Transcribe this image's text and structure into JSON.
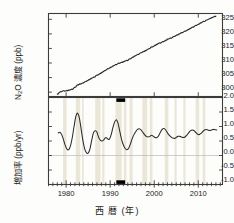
{
  "figure": {
    "xlabel": "西 暦 (年)",
    "background": "#fdfdfb",
    "axis_color": "#3c3c3c",
    "line_color": "#2a2a2a",
    "band_color": "#ebe7d8",
    "marker_color": "#000000"
  },
  "panels": {
    "top": {
      "ylabel_main": "N",
      "ylabel_sub": "2",
      "ylabel_rest": "O 濃度 (ppb)",
      "ylabel_full": "N2O 濃度 (ppb)",
      "yticks": [
        "325",
        "320",
        "315",
        "310",
        "305",
        "300"
      ],
      "ylim": [
        298.5,
        327.0
      ]
    },
    "bottom": {
      "ylabel_full": "増加率 (ppb/yr)",
      "yticks": [
        "2.0",
        "1.5",
        "1.0",
        "0.5",
        "0.0",
        "-0.5",
        "-1.0"
      ],
      "ylim": [
        -1.0,
        2.0
      ]
    }
  },
  "xaxis": {
    "ticks": [
      "1980",
      "1990",
      "2000",
      "2010"
    ],
    "tickvalues": [
      1980,
      1990,
      2000,
      2010
    ],
    "xlim": [
      1976.0,
      2015.5
    ]
  },
  "chart_data": {
    "type": "line",
    "title": "",
    "xlabel": "西 暦 (年)",
    "grid": false,
    "legend": "none",
    "subplots": [
      {
        "name": "n2o-concentration",
        "type": "line",
        "ylabel": "N2O 濃度 (ppb)",
        "ylim": [
          298.5,
          327.0
        ],
        "yticks": [
          300,
          305,
          310,
          315,
          320,
          325
        ],
        "xlim": [
          1976.0,
          2015.5
        ],
        "x": [
          1978.0,
          1978.5,
          1979.0,
          1979.5,
          1980.0,
          1980.5,
          1981.0,
          1981.5,
          1982.0,
          1982.5,
          1983.0,
          1983.5,
          1984.0,
          1984.5,
          1985.0,
          1985.5,
          1986.0,
          1986.5,
          1987.0,
          1987.5,
          1988.0,
          1988.5,
          1989.0,
          1989.5,
          1990.0,
          1990.5,
          1991.0,
          1991.5,
          1992.0,
          1992.5,
          1993.0,
          1993.5,
          1994.0,
          1994.5,
          1995.0,
          1995.5,
          1996.0,
          1996.5,
          1997.0,
          1997.5,
          1998.0,
          1998.5,
          1999.0,
          1999.5,
          2000.0,
          2000.5,
          2001.0,
          2001.5,
          2002.0,
          2002.5,
          2003.0,
          2003.5,
          2004.0,
          2004.5,
          2005.0,
          2005.5,
          2006.0,
          2006.5,
          2007.0,
          2007.5,
          2008.0,
          2008.5,
          2009.0,
          2009.5,
          2010.0,
          2010.5,
          2011.0,
          2011.5,
          2012.0,
          2012.5,
          2013.0,
          2013.5,
          2014.0
        ],
        "y": [
          299.2,
          299.9,
          300.3,
          300.4,
          300.5,
          300.6,
          300.8,
          301.1,
          301.6,
          302.4,
          302.7,
          302.9,
          303.3,
          303.7,
          304.1,
          304.5,
          304.9,
          305.3,
          305.8,
          306.2,
          306.6,
          307.1,
          307.6,
          308.0,
          308.4,
          308.8,
          309.2,
          309.6,
          309.9,
          310.2,
          310.4,
          310.7,
          311.0,
          311.4,
          311.9,
          312.3,
          312.7,
          313.1,
          313.5,
          313.9,
          314.2,
          314.6,
          315.1,
          315.5,
          315.9,
          316.3,
          316.7,
          317.0,
          317.3,
          317.7,
          318.1,
          318.4,
          318.7,
          319.1,
          319.5,
          319.8,
          320.2,
          320.6,
          320.9,
          321.3,
          321.7,
          322.1,
          322.5,
          322.9,
          323.3,
          323.7,
          324.1,
          324.4,
          324.8,
          325.2,
          325.5,
          325.8,
          326.1
        ],
        "series_note": "monotonic increase ~299 ppb (1978) to ~326 ppb (2014)"
      },
      {
        "name": "n2o-growth-rate",
        "type": "line",
        "ylabel": "増加率 (ppb/yr)",
        "ylim": [
          -1.0,
          2.0
        ],
        "yticks": [
          -1.0,
          -0.5,
          0.0,
          0.5,
          1.0,
          1.5,
          2.0
        ],
        "xlim": [
          1976.0,
          2015.5
        ],
        "zero_line": 0.0,
        "x": [
          1978.2,
          1978.6,
          1979.0,
          1979.4,
          1979.8,
          1980.2,
          1980.6,
          1981.0,
          1981.4,
          1981.8,
          1982.2,
          1982.6,
          1983.0,
          1983.4,
          1983.8,
          1984.2,
          1984.6,
          1985.0,
          1985.4,
          1985.8,
          1986.2,
          1986.6,
          1987.0,
          1987.4,
          1987.8,
          1988.2,
          1988.6,
          1989.0,
          1989.4,
          1989.8,
          1990.2,
          1990.6,
          1991.0,
          1991.4,
          1991.8,
          1992.2,
          1992.6,
          1993.0,
          1993.4,
          1993.8,
          1994.2,
          1994.6,
          1995.0,
          1995.4,
          1995.8,
          1996.2,
          1996.6,
          1997.0,
          1997.4,
          1997.8,
          1998.2,
          1998.6,
          1999.0,
          1999.4,
          1999.8,
          2000.2,
          2000.6,
          2001.0,
          2001.4,
          2001.8,
          2002.2,
          2002.6,
          2003.0,
          2003.4,
          2003.8,
          2004.2,
          2004.6,
          2005.0,
          2005.4,
          2005.8,
          2006.2,
          2006.6,
          2007.0,
          2007.4,
          2007.8,
          2008.2,
          2008.6,
          2009.0,
          2009.4,
          2009.8,
          2010.2,
          2010.6,
          2011.0,
          2011.4,
          2011.8,
          2012.2,
          2012.6,
          2013.0,
          2013.4,
          2013.8,
          2014.2
        ],
        "y": [
          0.78,
          0.8,
          0.72,
          0.55,
          0.35,
          0.22,
          0.2,
          0.34,
          0.62,
          1.0,
          1.34,
          1.46,
          1.3,
          0.92,
          0.52,
          0.24,
          0.1,
          0.08,
          0.22,
          0.52,
          0.78,
          0.85,
          0.8,
          0.62,
          0.52,
          0.5,
          0.55,
          0.62,
          0.58,
          0.56,
          0.7,
          0.95,
          1.15,
          1.23,
          1.1,
          0.82,
          0.55,
          0.36,
          0.24,
          0.2,
          0.25,
          0.4,
          0.58,
          0.72,
          0.82,
          0.9,
          0.92,
          0.88,
          0.8,
          0.72,
          0.66,
          0.64,
          0.66,
          0.7,
          0.66,
          0.62,
          0.62,
          0.68,
          0.8,
          0.9,
          0.93,
          0.88,
          0.78,
          0.7,
          0.64,
          0.6,
          0.59,
          0.62,
          0.66,
          0.66,
          0.64,
          0.62,
          0.64,
          0.7,
          0.78,
          0.85,
          0.88,
          0.86,
          0.8,
          0.74,
          0.72,
          0.76,
          0.82,
          0.88,
          0.9,
          0.88,
          0.86,
          0.88,
          0.9,
          0.89,
          0.88
        ],
        "series_note": "oscillating growth rate 0.1-1.5 ppb/yr"
      }
    ],
    "shaded_bands": [
      {
        "start": 1979.3,
        "end": 1980.1
      },
      {
        "start": 1982.2,
        "end": 1983.2
      },
      {
        "start": 1983.6,
        "end": 1984.0
      },
      {
        "start": 1986.6,
        "end": 1987.8
      },
      {
        "start": 1988.2,
        "end": 1988.7
      },
      {
        "start": 1991.2,
        "end": 1992.6
      },
      {
        "start": 1993.1,
        "end": 1993.7
      },
      {
        "start": 1994.4,
        "end": 1995.1
      },
      {
        "start": 1997.3,
        "end": 1998.4
      },
      {
        "start": 1999.0,
        "end": 1999.6
      },
      {
        "start": 2002.4,
        "end": 2003.2
      },
      {
        "start": 2004.6,
        "end": 2005.1
      },
      {
        "start": 2006.6,
        "end": 2007.1
      },
      {
        "start": 2009.4,
        "end": 2010.2
      },
      {
        "start": 2011.0,
        "end": 2011.6
      }
    ],
    "event_markers": [
      {
        "start": 1991.4,
        "end": 1993.4,
        "position": "top"
      },
      {
        "start": 1991.4,
        "end": 1993.4,
        "position": "bottom"
      }
    ]
  }
}
